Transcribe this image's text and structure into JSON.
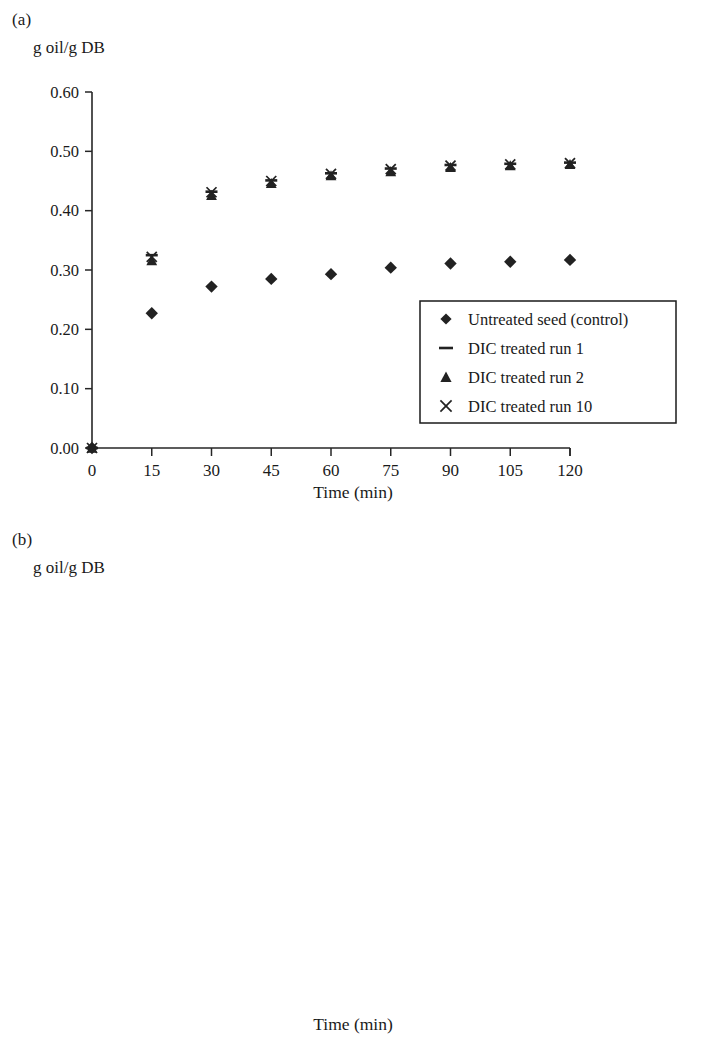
{
  "figure": {
    "ylabel": "g oil/g DB",
    "xlabel": "Time (min)"
  },
  "panels": [
    {
      "tag": "(a)",
      "name": "panel-a"
    },
    {
      "tag": "(b)",
      "name": "panel-b"
    }
  ],
  "legend": {
    "marker_names": [
      "filled-diamond-marker",
      "dash-marker",
      "triangle-marker",
      "cross-marker"
    ]
  },
  "chart_data": [
    {
      "type": "scatter",
      "panel": "(a)",
      "title": "",
      "xlabel": "Time (min)",
      "ylabel": "g oil/g DB",
      "xlim": [
        0,
        120
      ],
      "ylim": [
        0.0,
        0.6
      ],
      "xticks": [
        0,
        15,
        30,
        45,
        60,
        75,
        90,
        105,
        120
      ],
      "yticks": [
        "0.00",
        "0.10",
        "0.20",
        "0.30",
        "0.40",
        "0.50",
        "0.60"
      ],
      "grid": false,
      "legend_position": "lower-right",
      "x": [
        0,
        15,
        30,
        45,
        60,
        75,
        90,
        105,
        120
      ],
      "series": [
        {
          "name": "Untreated seed (control)",
          "marker": "filled-diamond",
          "values": [
            0.0,
            0.227,
            0.272,
            0.285,
            0.293,
            0.304,
            0.311,
            0.314,
            0.317
          ]
        },
        {
          "name": "DIC treated run 1",
          "marker": "dash",
          "values": [
            0.0,
            0.325,
            0.432,
            0.451,
            0.463,
            0.471,
            0.477,
            0.479,
            0.481
          ]
        },
        {
          "name": "DIC treated run 2",
          "marker": "triangle",
          "values": [
            0.0,
            0.316,
            0.426,
            0.446,
            0.459,
            0.466,
            0.473,
            0.476,
            0.478
          ]
        },
        {
          "name": "DIC treated run 10",
          "marker": "cross",
          "values": [
            0.0,
            0.322,
            0.431,
            0.45,
            0.462,
            0.47,
            0.476,
            0.478,
            0.48
          ]
        }
      ]
    },
    {
      "type": "scatter",
      "panel": "(b)",
      "title": "",
      "xlabel": "Time (min)",
      "ylabel": "g oil/g DB",
      "xlim": [
        0,
        120
      ],
      "ylim": [
        0.0,
        0.6
      ],
      "xticks": [
        0,
        15,
        30,
        45,
        60,
        75,
        90,
        105,
        120
      ],
      "yticks": [
        "0.00",
        "0.10",
        "0.20",
        "0.30",
        "0.40",
        "0.50",
        "0.60"
      ],
      "grid": false,
      "legend_position": "lower-right",
      "x": [
        0,
        15,
        30,
        45,
        60,
        75,
        90,
        105,
        120
      ],
      "series": [
        {
          "name": "Untreated seed (control)",
          "marker": "filled-diamond",
          "values": [
            0.0,
            0.325,
            0.401,
            0.426,
            0.443,
            0.45,
            0.455,
            0.459,
            0.46
          ]
        },
        {
          "name": "DIC treated run 1",
          "marker": "dash",
          "values": [
            0.0,
            0.405,
            0.483,
            0.497,
            0.505,
            0.508,
            0.51,
            0.51,
            0.511
          ]
        },
        {
          "name": "DIC treated run 2",
          "marker": "triangle",
          "values": [
            0.0,
            0.4,
            0.477,
            0.493,
            0.5,
            0.504,
            0.505,
            0.506,
            0.507
          ]
        },
        {
          "name": "DIC treated run 8",
          "marker": "cross",
          "values": [
            0.0,
            0.393,
            0.47,
            0.486,
            0.492,
            0.496,
            0.498,
            0.499,
            0.5
          ]
        }
      ]
    }
  ]
}
